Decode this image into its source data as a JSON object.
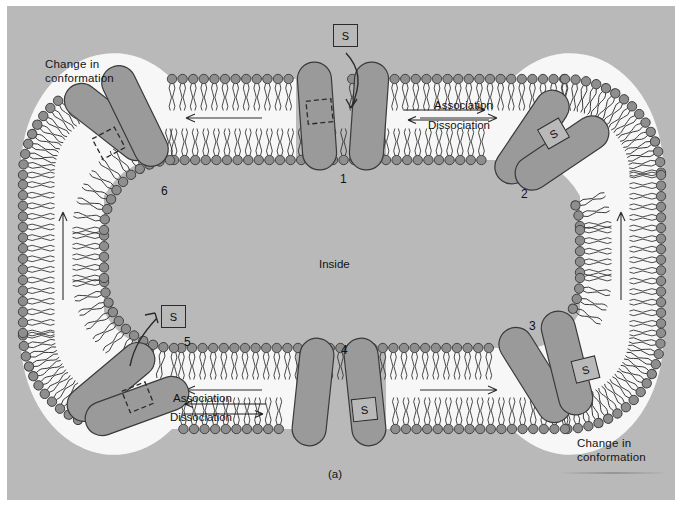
{
  "figure": {
    "caption": "(a)",
    "inside_label": "Inside",
    "background_color": "#b9b9b9",
    "protein_color": "#9a9a9a",
    "lipid_head_color": "#8e8e8e",
    "outline_color": "#3a3a3a"
  },
  "substrate": {
    "symbol": "S"
  },
  "stages": [
    {
      "number": "1",
      "x": 340,
      "y": 178,
      "note": "empty binding site facing outside"
    },
    {
      "number": "2",
      "x": 523,
      "y": 193,
      "note": "substrate bound, carrier in membrane"
    },
    {
      "number": "3",
      "x": 531,
      "y": 325,
      "note": "substrate bound, conformation change"
    },
    {
      "number": "4",
      "x": 343,
      "y": 349,
      "note": "substrate bound facing inside"
    },
    {
      "number": "5",
      "x": 186,
      "y": 341,
      "note": "substrate released, empty site"
    },
    {
      "number": "6",
      "x": 163,
      "y": 190,
      "note": "empty carrier, conformation change"
    }
  ],
  "s_boxes": [
    {
      "id": "s-top",
      "x": 333,
      "y": 24,
      "label": "S"
    },
    {
      "id": "s-right-upper",
      "x": 541,
      "y": 122,
      "label": "S"
    },
    {
      "id": "s-right-lower",
      "x": 573,
      "y": 358,
      "label": "S"
    },
    {
      "id": "s-bottom",
      "x": 352,
      "y": 398,
      "label": "S"
    },
    {
      "id": "s-left",
      "x": 161,
      "y": 305,
      "label": "S"
    }
  ],
  "annotations": [
    {
      "id": "change-top-left",
      "text": "Change in\nconformation",
      "x": 45,
      "y": 58
    },
    {
      "id": "change-bottom-right",
      "text": "Change in\nconformation",
      "x": 577,
      "y": 437
    }
  ],
  "reaction_labels": [
    {
      "id": "association-top",
      "text": "Association",
      "x": 434,
      "y": 99,
      "arrow": "right"
    },
    {
      "id": "dissociation-top",
      "text": "Dissociation",
      "x": 428,
      "y": 119,
      "arrow": "left"
    },
    {
      "id": "association-bottom",
      "text": "Association",
      "x": 173,
      "y": 392,
      "arrow": "left"
    },
    {
      "id": "dissociation-bottom",
      "text": "Dissociation",
      "x": 170,
      "y": 411,
      "arrow": "right"
    }
  ]
}
